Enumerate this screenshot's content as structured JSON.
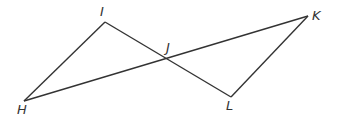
{
  "diagram": {
    "type": "geometry",
    "points": {
      "I": {
        "label": "I",
        "x": 105,
        "y": 22
      },
      "H": {
        "label": "H",
        "x": 24,
        "y": 101
      },
      "J": {
        "label": "J",
        "x": 169,
        "y": 59
      },
      "K": {
        "label": "K",
        "x": 308,
        "y": 16
      },
      "L": {
        "label": "L",
        "x": 231,
        "y": 97
      }
    },
    "segments": [
      [
        "H",
        "I"
      ],
      [
        "I",
        "L"
      ],
      [
        "H",
        "K"
      ],
      [
        "K",
        "L"
      ]
    ],
    "line_color": "#333333"
  }
}
